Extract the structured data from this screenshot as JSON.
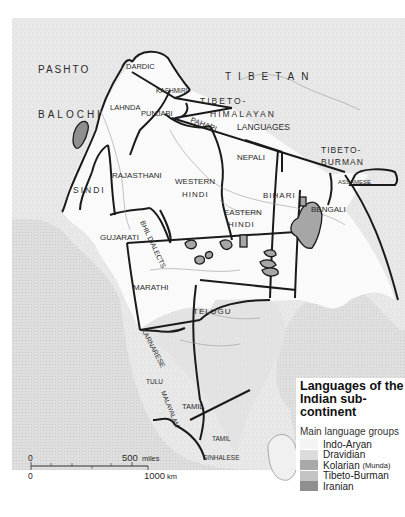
{
  "map": {
    "title_line1": "Languages of the",
    "title_line2": "Indian sub-continent",
    "external_labels": {
      "pashto": "PASHTO",
      "balochi": "BALOCHI",
      "tibetan": "TIBETAN",
      "tibeto_himalayan_1": "TIBETO-",
      "tibeto_himalayan_2": "HIMALAYAN",
      "tibeto_himalayan_3": "LANGUAGES",
      "tibeto_burman_1": "TIBETO-",
      "tibeto_burman_2": "BURMAN"
    },
    "regions": {
      "dardic": "DARDIC",
      "kashmiri": "KASHMIRI",
      "lahnda": "LAHNDA",
      "punjabi": "PUNJABI",
      "pahari": "PAHARI",
      "nepali": "NEPALI",
      "sindi": "SINDI",
      "rajasthani": "RAJASTHANI",
      "western_hindi_1": "WESTERN",
      "western_hindi_2": "HINDI",
      "eastern_hindi_1": "EASTERN",
      "eastern_hindi_2": "HINDI",
      "bihari": "BIHARI",
      "bengali": "BENGALI",
      "assamese": "ASSAMESE",
      "gujarati": "GUJARATI",
      "bhil_dialects": "BHIL DIALECTS",
      "marathi": "MARATHI",
      "telugu": "TELUGU",
      "karnarese": "KARNARESE",
      "tulu": "TULU",
      "malayalam": "MALAYALAM",
      "tamil": "TAMIL",
      "tamil_ceylon": "TAMIL",
      "sinhalese": "SINHALESE"
    },
    "scale_bar": {
      "miles_zero": "0",
      "miles_max": "500",
      "miles_unit": "miles",
      "km_zero": "0",
      "km_max": "1000",
      "km_unit": "km"
    }
  },
  "legend": {
    "subtitle": "Main language groups",
    "items": [
      {
        "label": "Indo-Aryan",
        "note": "",
        "color": "#f4f4f4"
      },
      {
        "label": "Dravidian",
        "note": "",
        "color": "#dcdcdc"
      },
      {
        "label": "Kolarian",
        "note": "(Munda)",
        "color": "#a9a9a9"
      },
      {
        "label": "Tibeto-Burman",
        "note": "",
        "color": "#c4c4c4"
      },
      {
        "label": "Iranian",
        "note": "",
        "color": "#8f8f8f"
      }
    ]
  },
  "colors": {
    "background_land": "#ececec",
    "sea": "#dedede",
    "indo_aryan": "#fafafa",
    "dravidian": "#e2e2e2",
    "kolarian": "#a6a6a6",
    "border": "#1a1a1a"
  }
}
